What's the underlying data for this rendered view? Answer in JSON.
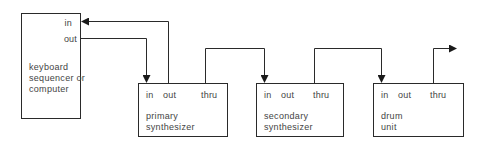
{
  "diagram": {
    "type": "MIDI daisy-chain connection diagram",
    "controller": {
      "name_lines": [
        "keyboard",
        "sequencer or",
        "computer"
      ],
      "ports": {
        "in": "in",
        "out": "out"
      }
    },
    "devices": [
      {
        "name_lines": [
          "primary",
          "synthesizer"
        ],
        "ports": {
          "in": "in",
          "out": "out",
          "thru": "thru"
        }
      },
      {
        "name_lines": [
          "secondary",
          "synthesizer"
        ],
        "ports": {
          "in": "in",
          "out": "out",
          "thru": "thru"
        }
      },
      {
        "name_lines": [
          "drum",
          "unit"
        ],
        "ports": {
          "in": "in",
          "out": "out",
          "thru": "thru"
        }
      }
    ],
    "connections": [
      {
        "from": "controller.out",
        "to": "primary synthesizer.in"
      },
      {
        "from": "primary synthesizer.out",
        "to": "controller.in"
      },
      {
        "from": "primary synthesizer.thru",
        "to": "secondary synthesizer.in"
      },
      {
        "from": "secondary synthesizer.thru",
        "to": "drum unit.in"
      },
      {
        "from": "drum unit.thru",
        "to": "onward (unconnected arrow)"
      }
    ],
    "colors": {
      "line": "#2a2a2a",
      "text": "#444444",
      "background": "#ffffff"
    }
  }
}
